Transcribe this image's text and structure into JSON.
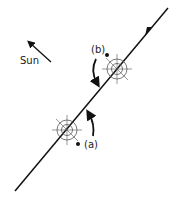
{
  "diagram": {
    "labels": {
      "sun": "Sun",
      "a": "(a)",
      "b": "(b)"
    },
    "colors": {
      "ink": "#111111",
      "thin": "#555555",
      "background": "#ffffff"
    },
    "icons": {
      "sun_direction": "arrow-up-left",
      "path_direction": "arrow-up-right",
      "rotation_a": "curved-arrow-up",
      "rotation_b": "curved-arrow-down",
      "body": "crosshair-circle"
    }
  }
}
